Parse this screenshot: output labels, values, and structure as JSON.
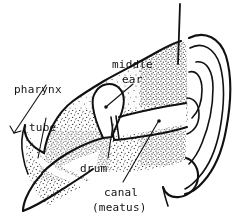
{
  "figure": {
    "style": "hand-drawn stippled line illustration",
    "background_color": "#ffffff",
    "ink_color": "#111111",
    "width": 234,
    "height": 224
  },
  "labels": {
    "pharynx": "pharynx",
    "tube": "tube",
    "middle": "middle",
    "ear": "ear",
    "drum": "drum",
    "canal": "canal",
    "meatus": "(meatus)"
  },
  "parts": [
    {
      "name": "pharynx",
      "label": "pharynx"
    },
    {
      "name": "eustachian-tube",
      "label": "tube"
    },
    {
      "name": "middle-ear",
      "label": "middle ear"
    },
    {
      "name": "eardrum",
      "label": "drum"
    },
    {
      "name": "ear-canal",
      "label": "canal (meatus)"
    },
    {
      "name": "pinna",
      "label": ""
    }
  ]
}
